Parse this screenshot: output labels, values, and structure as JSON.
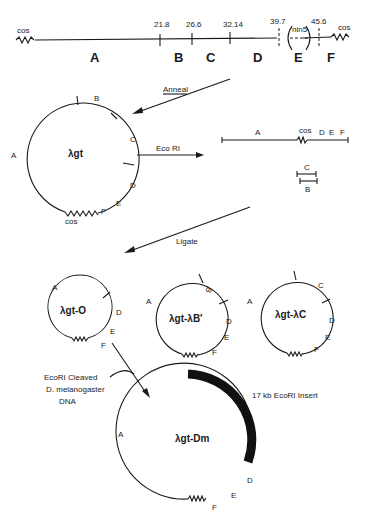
{
  "top_map": {
    "left_end": "cos",
    "right_end": "cos",
    "positions": [
      "21.8",
      "26.6",
      "32.14",
      "39.7",
      "45.6"
    ],
    "segments": [
      "A",
      "B",
      "C",
      "D",
      "E",
      "F"
    ],
    "deletion_label": "nin5"
  },
  "steps": {
    "anneal": "Anneal",
    "ecori": "Eco RI",
    "ligate": "Ligate"
  },
  "circle_lgt": {
    "name": "λgt",
    "labels": {
      "A": "A",
      "B": "B",
      "C": "C",
      "D": "D",
      "E": "E",
      "F": "F",
      "cos": "cos"
    }
  },
  "linear_fragments": {
    "main": {
      "A": "A",
      "cos": "cos",
      "D": "D",
      "E": "E",
      "F": "F"
    },
    "small_c": "C",
    "small_b": "B"
  },
  "products": [
    {
      "name": "λgt-O",
      "labels": [
        "A",
        "D",
        "E",
        "F"
      ]
    },
    {
      "name": "λgt-λB′",
      "labels": [
        "A",
        "B",
        "D",
        "E",
        "F"
      ]
    },
    {
      "name": "λgt-λC",
      "labels": [
        "A",
        "C",
        "D",
        "E",
        "F"
      ]
    }
  ],
  "insert_source": {
    "line1": "EcoRI Cleaved",
    "line2": "D. melanogaster",
    "line3": "DNA"
  },
  "final": {
    "name": "λgt-Dm",
    "insert_label": "17 kb EcoRI Insert",
    "labels": {
      "A": "A",
      "D": "D",
      "E": "E",
      "F": "F"
    }
  },
  "colors": {
    "ink": "#1a1a1a",
    "background": "#ffffff"
  }
}
